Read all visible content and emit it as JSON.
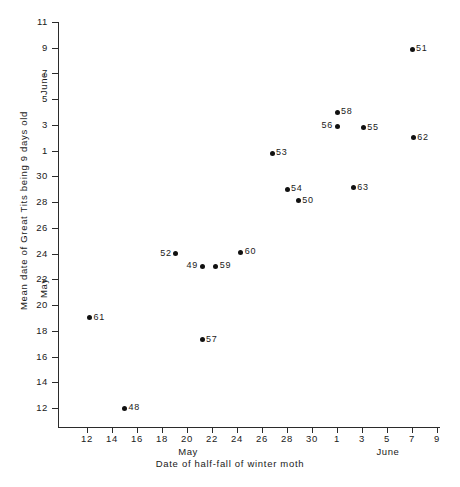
{
  "chart_data": {
    "type": "scatter",
    "title": "",
    "xlabel": "Date of half-fall of winter moth",
    "ylabel": "Mean date of Great Tits being 9 days old",
    "x_month_labels": [
      "May",
      "June"
    ],
    "y_month_labels": [
      "May",
      "June"
    ],
    "xlim": [
      10,
      40
    ],
    "ylim": [
      10,
      42
    ],
    "grid": false,
    "legend": null,
    "x_axis_note": "Dates: 12-30 are May; 1-9 are June (day 32 = June 1)",
    "y_axis_note": "Dates: 12-30 are May; 1-11 are June (day 32 = June 1)",
    "x_ticks": [
      {
        "value": 12,
        "label": "12",
        "month": "May"
      },
      {
        "value": 14,
        "label": "14",
        "month": "May"
      },
      {
        "value": 16,
        "label": "16",
        "month": "May"
      },
      {
        "value": 18,
        "label": "18",
        "month": "May"
      },
      {
        "value": 20,
        "label": "20",
        "month": "May"
      },
      {
        "value": 22,
        "label": "22",
        "month": "May"
      },
      {
        "value": 24,
        "label": "24",
        "month": "May"
      },
      {
        "value": 26,
        "label": "26",
        "month": "May"
      },
      {
        "value": 28,
        "label": "28",
        "month": "May"
      },
      {
        "value": 30,
        "label": "30",
        "month": "May"
      },
      {
        "value": 32,
        "label": "1",
        "month": "June"
      },
      {
        "value": 34,
        "label": "3",
        "month": "June"
      },
      {
        "value": 36,
        "label": "5",
        "month": "June"
      },
      {
        "value": 38,
        "label": "7",
        "month": "June"
      },
      {
        "value": 40,
        "label": "9",
        "month": "June"
      }
    ],
    "y_ticks": [
      {
        "value": 12,
        "label": "12",
        "month": "May"
      },
      {
        "value": 14,
        "label": "14",
        "month": "May"
      },
      {
        "value": 16,
        "label": "16",
        "month": "May"
      },
      {
        "value": 18,
        "label": "18",
        "month": "May"
      },
      {
        "value": 20,
        "label": "20",
        "month": "May"
      },
      {
        "value": 22,
        "label": "22",
        "month": "May"
      },
      {
        "value": 24,
        "label": "24",
        "month": "May"
      },
      {
        "value": 26,
        "label": "26",
        "month": "May"
      },
      {
        "value": 28,
        "label": "28",
        "month": "May"
      },
      {
        "value": 30,
        "label": "30",
        "month": "May"
      },
      {
        "value": 32,
        "label": "1",
        "month": "June"
      },
      {
        "value": 34,
        "label": "3",
        "month": "June"
      },
      {
        "value": 36,
        "label": "5",
        "month": "June"
      },
      {
        "value": 38,
        "label": "7",
        "month": "June"
      },
      {
        "value": 40,
        "label": "9",
        "month": "June"
      },
      {
        "value": 42,
        "label": "11",
        "month": "June"
      }
    ],
    "points": [
      {
        "label": "48",
        "x": 15.0,
        "y": 12.0,
        "label_side": "right"
      },
      {
        "label": "61",
        "x": 12.2,
        "y": 19.0,
        "label_side": "right"
      },
      {
        "label": "57",
        "x": 21.2,
        "y": 17.3,
        "label_side": "right"
      },
      {
        "label": "52",
        "x": 19.1,
        "y": 24.0,
        "label_side": "left"
      },
      {
        "label": "49",
        "x": 21.2,
        "y": 23.0,
        "label_side": "left"
      },
      {
        "label": "59",
        "x": 22.3,
        "y": 23.0,
        "label_side": "right"
      },
      {
        "label": "60",
        "x": 24.3,
        "y": 24.1,
        "label_side": "right"
      },
      {
        "label": "53",
        "x": 26.8,
        "y": 31.8,
        "label_side": "right"
      },
      {
        "label": "54",
        "x": 28.0,
        "y": 29.0,
        "label_side": "right"
      },
      {
        "label": "50",
        "x": 28.9,
        "y": 28.1,
        "label_side": "right"
      },
      {
        "label": "63",
        "x": 33.3,
        "y": 29.1,
        "label_side": "right"
      },
      {
        "label": "58",
        "x": 32.0,
        "y": 35.0,
        "label_side": "right"
      },
      {
        "label": "56",
        "x": 32.0,
        "y": 33.9,
        "label_side": "left"
      },
      {
        "label": "55",
        "x": 34.1,
        "y": 33.8,
        "label_side": "right"
      },
      {
        "label": "62",
        "x": 38.1,
        "y": 33.0,
        "label_side": "right"
      },
      {
        "label": "51",
        "x": 38.0,
        "y": 39.9,
        "label_side": "right"
      }
    ]
  },
  "axis_titles": {
    "x": "Date of half-fall of winter moth",
    "y": "Mean date of Great Tits being 9 days old"
  },
  "month_captions": {
    "x_may": "May",
    "x_june": "June",
    "y_may": "May",
    "y_june": "June"
  },
  "colors": {
    "background": "#ffffff",
    "axis": "#2b2b2b",
    "marker": "#111111",
    "text": "#1a1a1a"
  }
}
